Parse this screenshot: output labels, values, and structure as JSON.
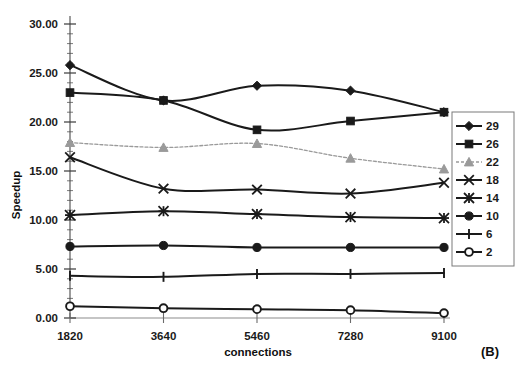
{
  "chart_data": {
    "type": "line",
    "title": "",
    "panel_label": "(B)",
    "xlabel": "connections",
    "ylabel": "Speedup",
    "x": [
      1820,
      3640,
      5460,
      7280,
      9100
    ],
    "xtick_labels": [
      "1820",
      "3640",
      "5460",
      "7280",
      "9100"
    ],
    "ytick_labels": [
      "0.00",
      "5.00",
      "10.00",
      "15.00",
      "20.00",
      "25.00",
      "30.00"
    ],
    "ytick_values": [
      0,
      5,
      10,
      15,
      20,
      25,
      30
    ],
    "ylim": [
      0,
      30
    ],
    "grid": false,
    "legend_position": "right",
    "minor_ticks_y": 1,
    "series": [
      {
        "name": "29",
        "marker": "diamond",
        "color": "#1a1a1a",
        "values": [
          25.8,
          22.2,
          23.7,
          23.2,
          21.0
        ]
      },
      {
        "name": "26",
        "marker": "square",
        "color": "#1a1a1a",
        "values": [
          23.0,
          22.2,
          19.2,
          20.1,
          21.0
        ]
      },
      {
        "name": "22",
        "marker": "triangle",
        "color": "#9a9a9a",
        "values": [
          17.9,
          17.4,
          17.8,
          16.3,
          15.2
        ]
      },
      {
        "name": "18",
        "marker": "x",
        "color": "#1a1a1a",
        "values": [
          16.4,
          13.2,
          13.1,
          12.7,
          13.8
        ]
      },
      {
        "name": "14",
        "marker": "asterisk",
        "color": "#1a1a1a",
        "values": [
          10.5,
          10.9,
          10.6,
          10.3,
          10.2
        ]
      },
      {
        "name": "10",
        "marker": "circle",
        "color": "#1a1a1a",
        "values": [
          7.3,
          7.4,
          7.2,
          7.2,
          7.2
        ]
      },
      {
        "name": "6",
        "marker": "plus",
        "color": "#1a1a1a",
        "values": [
          4.3,
          4.2,
          4.5,
          4.5,
          4.6
        ]
      },
      {
        "name": "2",
        "marker": "opencircle",
        "color": "#1a1a1a",
        "values": [
          1.2,
          1.0,
          0.9,
          0.8,
          0.5
        ]
      }
    ]
  },
  "legend": {
    "entries": [
      "29",
      "26",
      "22",
      "18",
      "14",
      "10",
      "6",
      "2"
    ]
  },
  "axes": {
    "y_title": "Speedup",
    "x_title": "connections"
  },
  "figure": {
    "panel_tag": "(B)"
  }
}
